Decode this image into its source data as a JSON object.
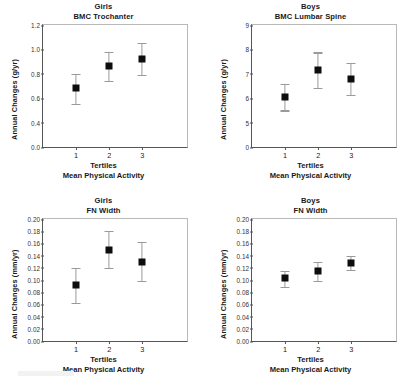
{
  "figure": {
    "axis_x_label_line1": "Tertiles",
    "axis_x_label_line2": "Mean Physical Activity"
  },
  "chart_data": [
    {
      "type": "scatter",
      "panel": "top-left",
      "title": "Girls",
      "subtitle": "BMC Trochanter",
      "xlabel": "Tertiles",
      "xlabel2": "Mean Physical Activity",
      "ylabel": "Annual Changes (g/yr)",
      "categories": [
        "1",
        "2",
        "3"
      ],
      "values": [
        0.68,
        0.86,
        0.92
      ],
      "err_low": [
        0.55,
        0.74,
        0.79
      ],
      "err_high": [
        0.8,
        0.98,
        1.05
      ],
      "yticks": [
        "0.0",
        "0.4",
        "0.6",
        "0.8",
        "1.0",
        "1.2"
      ],
      "ylim": [
        0.0,
        1.2
      ],
      "axis_break": true,
      "grid": false,
      "marker": "filled-square",
      "errorbar": "SE"
    },
    {
      "type": "scatter",
      "panel": "top-right",
      "title": "Boys",
      "subtitle": "BMC Lumbar Spine",
      "xlabel": "Tertiles",
      "xlabel2": "Mean Physical Activity",
      "ylabel": "Annual Changes (g/yr)",
      "categories": [
        "1",
        "2",
        "3"
      ],
      "values": [
        6.05,
        7.15,
        6.8
      ],
      "err_low": [
        5.5,
        6.43,
        6.15
      ],
      "err_high": [
        6.57,
        7.88,
        7.45
      ],
      "yticks": [
        "0",
        "5",
        "6",
        "7",
        "8",
        "9"
      ],
      "ylim": [
        0,
        9
      ],
      "axis_break": true,
      "grid": false,
      "marker": "filled-square",
      "errorbar": "SE"
    },
    {
      "type": "scatter",
      "panel": "bottom-left",
      "title": "Girls",
      "subtitle": "FN Width",
      "xlabel": "Tertiles",
      "xlabel2": "Mean Physical Activity",
      "ylabel": "Annual Changes (mm/yr)",
      "categories": [
        "1",
        "2",
        "3"
      ],
      "values": [
        0.091,
        0.15,
        0.13
      ],
      "err_low": [
        0.063,
        0.12,
        0.098
      ],
      "err_high": [
        0.12,
        0.18,
        0.162
      ],
      "yticks": [
        "0.00",
        "0.02",
        "0.04",
        "0.06",
        "0.08",
        "0.10",
        "0.12",
        "0.14",
        "0.16",
        "0.18",
        "0.20"
      ],
      "ylim": [
        0.0,
        0.2
      ],
      "axis_break": false,
      "grid": false,
      "marker": "filled-square",
      "errorbar": "SE"
    },
    {
      "type": "scatter",
      "panel": "bottom-right",
      "title": "Boys",
      "subtitle": "FN Width",
      "xlabel": "Tertiles",
      "xlabel2": "Mean Physical Activity",
      "ylabel": "Annual Changes (mm/yr)",
      "categories": [
        "1",
        "2",
        "3"
      ],
      "values": [
        0.103,
        0.114,
        0.128
      ],
      "err_low": [
        0.089,
        0.098,
        0.116
      ],
      "err_high": [
        0.115,
        0.13,
        0.14
      ],
      "yticks": [
        "0.00",
        "0.02",
        "0.04",
        "0.06",
        "0.08",
        "0.10",
        "0.12",
        "0.14",
        "0.16",
        "0.18",
        "0.20"
      ],
      "ylim": [
        0.0,
        0.2
      ],
      "axis_break": false,
      "grid": false,
      "marker": "filled-square",
      "errorbar": "SE"
    }
  ]
}
